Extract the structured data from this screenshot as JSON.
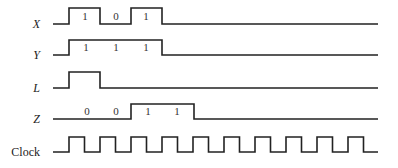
{
  "diagram": {
    "signals": [
      {
        "name": "X",
        "italic": true,
        "label_y": 28,
        "low_y": 24,
        "high_y": 8,
        "x_start": 53,
        "x_end": 378,
        "edges": [
          [
            69,
            1
          ],
          [
            100,
            0
          ],
          [
            131,
            1
          ],
          [
            162,
            0
          ]
        ],
        "values": [
          {
            "text": "1",
            "x": 85
          },
          {
            "text": "0",
            "x": 116
          },
          {
            "text": "1",
            "x": 146
          }
        ]
      },
      {
        "name": "Y",
        "italic": true,
        "label_y": 59,
        "low_y": 55,
        "high_y": 40,
        "x_start": 53,
        "x_end": 378,
        "edges": [
          [
            69,
            1
          ],
          [
            162,
            0
          ]
        ],
        "values": [
          {
            "text": "1",
            "x": 86
          },
          {
            "text": "1",
            "x": 116
          },
          {
            "text": "1",
            "x": 146
          }
        ]
      },
      {
        "name": "L",
        "italic": true,
        "label_y": 92,
        "low_y": 88,
        "high_y": 72,
        "x_start": 53,
        "x_end": 378,
        "edges": [
          [
            69,
            1
          ],
          [
            100,
            0
          ]
        ],
        "values": []
      },
      {
        "name": "Z",
        "italic": true,
        "label_y": 123,
        "low_y": 119,
        "high_y": 104,
        "x_start": 53,
        "x_end": 378,
        "edges": [
          [
            131,
            1
          ],
          [
            194,
            0
          ]
        ],
        "values": [
          {
            "text": "0",
            "x": 87
          },
          {
            "text": "0",
            "x": 116
          },
          {
            "text": "1",
            "x": 148
          },
          {
            "text": "1",
            "x": 177
          }
        ]
      },
      {
        "name": "Clock",
        "italic": false,
        "label_y": 156,
        "low_y": 152,
        "high_y": 137,
        "x_start": 53,
        "x_end": 378,
        "clock": {
          "first_rise": 69,
          "period": 31,
          "high_width": 15.5,
          "pulses": 10
        },
        "values": []
      }
    ]
  }
}
